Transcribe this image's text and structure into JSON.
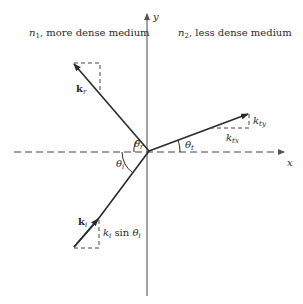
{
  "diagram": {
    "media": {
      "left": {
        "symbol": "n",
        "subscript": "1",
        "text": ", more dense medium"
      },
      "right": {
        "symbol": "n",
        "subscript": "2",
        "text": ", less dense medium"
      }
    },
    "axes": {
      "x_label": "x",
      "y_label": "y"
    },
    "vectors": {
      "reflected": {
        "symbol": "k",
        "subscript": "r"
      },
      "incident": {
        "symbol": "k",
        "subscript": "i"
      },
      "transmitted_y": {
        "symbol": "k",
        "subscript": "ty"
      },
      "transmitted_x": {
        "symbol": "k",
        "subscript": "tx"
      }
    },
    "angles": {
      "reflected": {
        "symbol": "θ",
        "subscript": "r"
      },
      "incident": {
        "symbol": "θ",
        "subscript": "i"
      },
      "transmitted": {
        "symbol": "θ",
        "subscript": "t"
      }
    },
    "component_label": {
      "k": "k",
      "k_sub": "i",
      "sin": " sin ",
      "theta": "θ",
      "theta_sub": "i"
    },
    "colors": {
      "line": "#2a2a2a",
      "axis": "#555555",
      "text": "#2a2a2a"
    }
  }
}
